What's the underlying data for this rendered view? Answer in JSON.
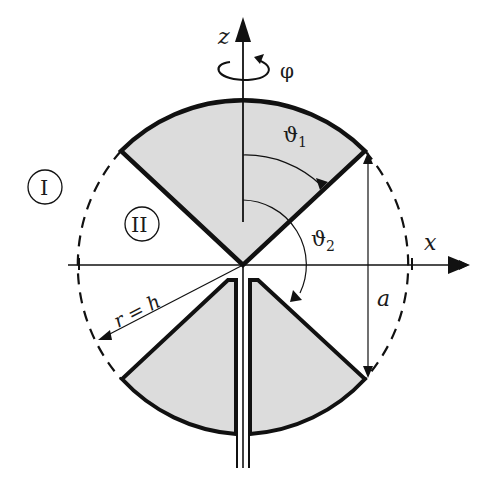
{
  "diagram": {
    "axes": {
      "z_label": "z",
      "x_label": "x",
      "rotation_label": "φ"
    },
    "regions": [
      {
        "id": "I",
        "label": "I"
      },
      {
        "id": "II",
        "label": "II"
      }
    ],
    "angles": {
      "theta1_symbol": "ϑ",
      "theta1_sub": "1",
      "theta2_symbol": "ϑ",
      "theta2_sub": "2"
    },
    "dimensions": {
      "radius_label": "r = h",
      "height_label": "a"
    },
    "colors": {
      "cone_fill": "#dcdcdc",
      "outline": "#111111",
      "background": "#ffffff"
    }
  }
}
